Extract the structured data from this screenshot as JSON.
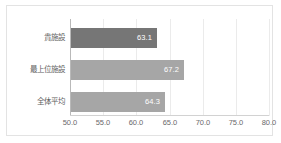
{
  "chart_data": {
    "type": "bar",
    "orientation": "horizontal",
    "title": "",
    "xlabel": "",
    "ylabel": "",
    "categories": [
      "貴施設",
      "最上位施設",
      "全体平均"
    ],
    "values": [
      63.1,
      67.2,
      64.3
    ],
    "value_labels": [
      "63.1",
      "67.2",
      "64.3"
    ],
    "xlim": [
      50.0,
      80.0
    ],
    "xticks": [
      50.0,
      55.0,
      60.0,
      65.0,
      70.0,
      75.0,
      80.0
    ],
    "xtick_labels": [
      "50.0",
      "55.0",
      "60.0",
      "65.0",
      "70.0",
      "75.0",
      "80.0"
    ],
    "grid": true,
    "grid_axis": "x",
    "legend": false,
    "bar_colors": [
      "#767676",
      "#a6a6a6",
      "#a6a6a6"
    ],
    "value_label_color": "#ffffff",
    "value_label_position": "inside-end"
  },
  "style": {
    "frame_border_color": "#e3e3e3",
    "gridline_color": "#ebebeb",
    "axis_line_color": "#b9b9b9",
    "baseline_color": "#d2d2d2",
    "tick_text_color": "#6a6a6a",
    "category_text_color": "#5e5e5e",
    "background": "#ffffff"
  }
}
